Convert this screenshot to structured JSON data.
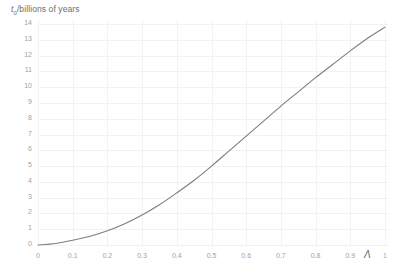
{
  "chart_data": {
    "type": "line",
    "title": "",
    "subtitle": "",
    "xlabel": "Λ",
    "ylabel": "t₀/billions of years",
    "ylabel_symbol": "t",
    "ylabel_subscript": "0",
    "ylabel_rest": "/billions of years",
    "xlim": [
      0,
      1
    ],
    "ylim": [
      0,
      14
    ],
    "grid": true,
    "legend": "none",
    "line_color": "#7d7d7d",
    "grid_color": "#f2f2f2",
    "text_color": "#a2a2a2",
    "background": "#ffffff",
    "xticks": [
      "0",
      "0.1",
      "0.2",
      "0.3",
      "0.4",
      "0.5",
      "0.6",
      "0.7",
      "0.8",
      "0.9",
      "1"
    ],
    "xtick_values": [
      0,
      0.1,
      0.2,
      0.3,
      0.4,
      0.5,
      0.6,
      0.7,
      0.8,
      0.9,
      1
    ],
    "yticks": [
      "0",
      "1",
      "2",
      "3",
      "4",
      "5",
      "6",
      "7",
      "8",
      "9",
      "10",
      "11",
      "12",
      "13",
      "14"
    ],
    "ytick_values": [
      0,
      1,
      2,
      3,
      4,
      5,
      6,
      7,
      8,
      9,
      10,
      11,
      12,
      13,
      14
    ],
    "series": [
      {
        "name": "t0 vs Lambda",
        "x": [
          0,
          0.05,
          0.1,
          0.15,
          0.2,
          0.25,
          0.3,
          0.35,
          0.4,
          0.45,
          0.5,
          0.55,
          0.6,
          0.65,
          0.7,
          0.75,
          0.8,
          0.85,
          0.9,
          0.95,
          1
        ],
        "values": [
          0.0,
          0.1,
          0.3,
          0.55,
          0.9,
          1.35,
          1.9,
          2.55,
          3.3,
          4.1,
          5.0,
          5.95,
          6.9,
          7.85,
          8.8,
          9.7,
          10.6,
          11.45,
          12.3,
          13.1,
          13.8
        ]
      }
    ]
  }
}
